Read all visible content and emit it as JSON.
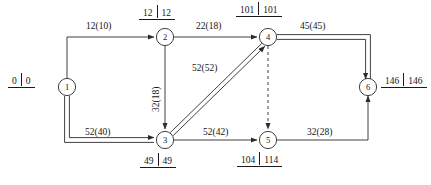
{
  "diagram": {
    "type": "cpm-network-diagram",
    "title": "",
    "stroke_color": "#2b2b2b",
    "critical_style": "double-line",
    "nodes": [
      {
        "id": "1",
        "label": "1",
        "x": 67,
        "y": 87,
        "early": "0",
        "late": "0",
        "time_pos": "left"
      },
      {
        "id": "2",
        "label": "2",
        "x": 165,
        "y": 37,
        "early": "12",
        "late": "12",
        "time_pos": "top"
      },
      {
        "id": "3",
        "label": "3",
        "x": 165,
        "y": 140,
        "early": "49",
        "late": "49",
        "time_pos": "bottom"
      },
      {
        "id": "4",
        "label": "4",
        "x": 268,
        "y": 37,
        "early": "101",
        "late": "101",
        "time_pos": "top"
      },
      {
        "id": "5",
        "label": "5",
        "x": 268,
        "y": 140,
        "early": "104",
        "late": "114",
        "time_pos": "bottom"
      },
      {
        "id": "6",
        "label": "6",
        "x": 368,
        "y": 87,
        "early": "146",
        "late": "146",
        "time_pos": "right"
      }
    ],
    "edges": [
      {
        "from": "1",
        "to": "2",
        "label": "12(10)",
        "duration": 12,
        "float": 10,
        "critical": false,
        "style": "solid",
        "label_x": 86,
        "label_y": 22
      },
      {
        "from": "2",
        "to": "4",
        "label": "22(18)",
        "duration": 22,
        "float": 18,
        "critical": false,
        "style": "solid",
        "label_x": 196,
        "label_y": 22
      },
      {
        "from": "2",
        "to": "3",
        "label": "32(18)",
        "duration": 32,
        "float": 18,
        "critical": false,
        "style": "solid",
        "label_x": 152,
        "label_y": 112,
        "vertical": true
      },
      {
        "from": "4",
        "to": "6",
        "label": "45(45)",
        "duration": 45,
        "float": 45,
        "critical": true,
        "style": "solid",
        "label_x": 300,
        "label_y": 22
      },
      {
        "from": "1",
        "to": "3",
        "label": "52(40)",
        "duration": 52,
        "float": 40,
        "critical": true,
        "style": "solid",
        "label_x": 85,
        "label_y": 128
      },
      {
        "from": "3",
        "to": "4",
        "label": "52(52)",
        "duration": 52,
        "float": 52,
        "critical": true,
        "style": "solid",
        "label_x": 192,
        "label_y": 64
      },
      {
        "from": "3",
        "to": "5",
        "label": "52(42)",
        "duration": 52,
        "float": 42,
        "critical": false,
        "style": "solid",
        "label_x": 203,
        "label_y": 128
      },
      {
        "from": "5",
        "to": "6",
        "label": "32(28)",
        "duration": 32,
        "float": 28,
        "critical": false,
        "style": "solid",
        "label_x": 307,
        "label_y": 128
      },
      {
        "from": "4",
        "to": "5",
        "label": "",
        "duration": 0,
        "float": 0,
        "critical": false,
        "style": "dashed",
        "label_x": 0,
        "label_y": 0
      }
    ],
    "time_labels": [
      {
        "node": "1",
        "early": "0",
        "late": "0",
        "x": 8,
        "y": 76
      },
      {
        "node": "2",
        "early": "12",
        "late": "12",
        "x": 140,
        "y": 8
      },
      {
        "node": "4",
        "early": "101",
        "late": "101",
        "x": 238,
        "y": 4
      },
      {
        "node": "6",
        "early": "146",
        "late": "146",
        "x": 383,
        "y": 78
      },
      {
        "node": "3",
        "early": "49",
        "late": "49",
        "x": 141,
        "y": 156
      },
      {
        "node": "5",
        "early": "104",
        "late": "114",
        "x": 239,
        "y": 155
      }
    ]
  }
}
